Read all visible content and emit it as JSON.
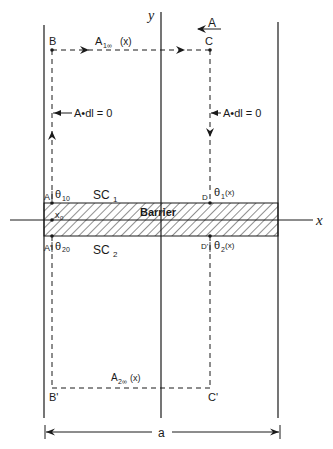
{
  "diagram": {
    "axes": {
      "x_label": "x",
      "y_label": "y"
    },
    "field_label": "A",
    "points": {
      "B": "B",
      "C": "C",
      "B_prime": "B'",
      "C_prime": "C'",
      "A": "A",
      "A_prime": "A'",
      "D": "D",
      "D_prime": "D'"
    },
    "path_labels": {
      "top": "A",
      "top_sub": "1∞",
      "top_arg": "(x)",
      "bottom": "A",
      "bottom_sub": "2∞",
      "bottom_arg": "(x)",
      "left_integral": "A•dl = 0",
      "right_integral": "A•dl = 0"
    },
    "phases": {
      "theta10": "θ",
      "theta10_sub": "10",
      "theta20": "θ",
      "theta20_sub": "20",
      "theta1x": "θ",
      "theta1x_sub": "1",
      "theta1x_arg": "(x)",
      "theta2x": "θ",
      "theta2x_sub": "2",
      "theta2x_arg": "(x)"
    },
    "regions": {
      "sc1": "SC",
      "sc1_sub": "1",
      "sc2": "SC",
      "sc2_sub": "2",
      "barrier": "Barrier"
    },
    "x0": {
      "label": "x",
      "sub": "0"
    },
    "dimension": "a"
  }
}
